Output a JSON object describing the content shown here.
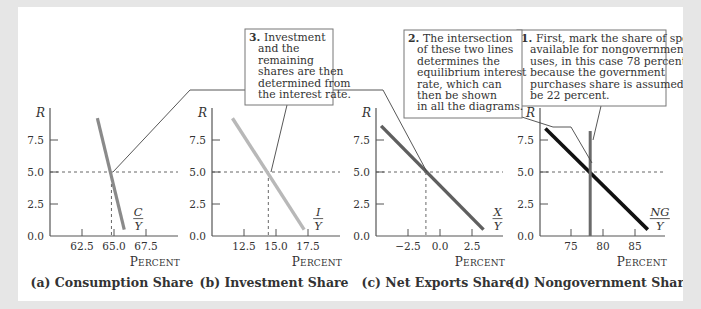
{
  "colors": {
    "frame": "#e6e6e6",
    "axis": "#555555",
    "dashed": "#555555",
    "consumption_line": "#8a8a8a",
    "investment_line": "#b8b8b8",
    "net_exports_line": "#5f5f5f",
    "nongovernment_line": "#111111",
    "supply_line": "#6a6a6a",
    "callout_border": "#777777",
    "leader": "#444444"
  },
  "chart_data": [
    {
      "type": "line",
      "id": "a",
      "title": "(a) Consumption Share",
      "xlabel": "Percent",
      "ylabel": "R",
      "xlim": [
        60.0,
        70.0
      ],
      "ylim": [
        0,
        10
      ],
      "x_ticks": [
        "62.5",
        "65.0",
        "67.5"
      ],
      "x_tick_values": [
        62.5,
        65.0,
        67.5
      ],
      "y_ticks": [
        "0.0",
        "2.5",
        "5.0",
        "7.5"
      ],
      "y_tick_values": [
        0.0,
        2.5,
        5.0,
        7.5
      ],
      "grid": false,
      "series": [
        {
          "name": "C/Y",
          "label_num": "C",
          "label_den": "Y",
          "x": [
            63.7,
            65.8
          ],
          "y": [
            9.2,
            0.5
          ]
        }
      ],
      "equilibrium": {
        "x": 64.8,
        "y": 5.0
      }
    },
    {
      "type": "line",
      "id": "b",
      "title": "(b) Investment Share",
      "xlabel": "Percent",
      "ylabel": "R",
      "xlim": [
        10.0,
        20.0
      ],
      "ylim": [
        0,
        10
      ],
      "x_ticks": [
        "12.5",
        "15.0",
        "17.5"
      ],
      "x_tick_values": [
        12.5,
        15.0,
        17.5
      ],
      "y_ticks": [
        "0.0",
        "2.5",
        "5.0",
        "7.5"
      ],
      "y_tick_values": [
        0.0,
        2.5,
        5.0,
        7.5
      ],
      "grid": false,
      "series": [
        {
          "name": "I/Y",
          "label_num": "I",
          "label_den": "Y",
          "x": [
            11.6,
            17.2
          ],
          "y": [
            9.2,
            0.5
          ]
        }
      ],
      "equilibrium": {
        "x": 14.4,
        "y": 5.0
      }
    },
    {
      "type": "line",
      "id": "c",
      "title": "(c) Net Exports Share",
      "xlabel": "Percent",
      "ylabel": "R",
      "xlim": [
        -5.0,
        5.0
      ],
      "ylim": [
        0,
        10
      ],
      "x_ticks": [
        "−2.5",
        "0.0",
        "2.5"
      ],
      "x_tick_values": [
        -2.5,
        0.0,
        2.5
      ],
      "y_ticks": [
        "0.0",
        "2.5",
        "5.0",
        "7.5"
      ],
      "y_tick_values": [
        0.0,
        2.5,
        5.0,
        7.5
      ],
      "grid": false,
      "series": [
        {
          "name": "X/Y",
          "label_num": "X",
          "label_den": "Y",
          "x": [
            -4.6,
            3.4
          ],
          "y": [
            8.6,
            0.5
          ]
        }
      ],
      "equilibrium": {
        "x": -1.1,
        "y": 5.0
      }
    },
    {
      "type": "line",
      "id": "d",
      "title": "(d) Nongovernment Share",
      "xlabel": "Percent",
      "ylabel": "R",
      "xlim": [
        70.0,
        90.0
      ],
      "ylim": [
        0,
        10
      ],
      "x_ticks": [
        "75",
        "80",
        "85"
      ],
      "x_tick_values": [
        75,
        80,
        85
      ],
      "y_ticks": [
        "0.0",
        "2.5",
        "5.0",
        "7.5"
      ],
      "y_tick_values": [
        0.0,
        2.5,
        5.0,
        7.5
      ],
      "grid": false,
      "series": [
        {
          "name": "NG/Y",
          "label_num": "NG",
          "label_den": "Y",
          "x": [
            71.0,
            87.0
          ],
          "y": [
            8.4,
            0.5
          ]
        },
        {
          "name": "Nongovernment supply (78%)",
          "x": [
            78.0,
            78.0
          ],
          "y": [
            8.2,
            0.0
          ]
        }
      ],
      "equilibrium": {
        "x": 78.0,
        "y": 5.0
      }
    }
  ],
  "callouts": [
    {
      "num": "1.",
      "lines": [
        "First, mark the share of spending",
        "available for nongovernment",
        "uses, in this case 78 percent",
        "because the government",
        "purchases share is assumed to",
        "be 22 percent."
      ]
    },
    {
      "num": "2.",
      "lines": [
        "The intersection",
        "of these two lines",
        "determines the",
        "equilibrium interest",
        "rate, which can",
        "then be shown",
        "in all the diagrams."
      ]
    },
    {
      "num": "3.",
      "lines": [
        "Investment",
        "and the",
        "remaining",
        "shares are then",
        "determined from",
        "the interest rate."
      ]
    }
  ],
  "labels": {
    "percent": "Percent",
    "r": "R"
  }
}
